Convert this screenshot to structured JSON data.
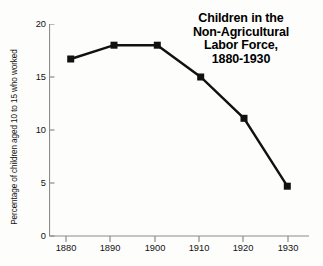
{
  "chart_data": {
    "type": "line",
    "title": "Children in the Non-Agricultural Labor Force, 1880-1930",
    "title_lines": [
      "Children in the",
      "Non-Agricultural",
      "Labor Force,",
      "1880-1930"
    ],
    "xlabel": "",
    "ylabel": "Percentage of children aged 10 to 15 who worked",
    "categories": [
      "1880",
      "1890",
      "1900",
      "1910",
      "1920",
      "1930"
    ],
    "x": [
      1880,
      1890,
      1900,
      1910,
      1920,
      1930
    ],
    "values": [
      16.7,
      18.0,
      18.0,
      15.0,
      11.1,
      4.7
    ],
    "series": [
      {
        "name": "Percentage of children aged 10 to 15 who worked",
        "values": [
          16.7,
          18.0,
          18.0,
          15.0,
          11.1,
          4.7
        ]
      }
    ],
    "xlim": [
      1875,
      1935
    ],
    "ylim": [
      0,
      20
    ],
    "ytick_labels": [
      "0",
      "5",
      "10",
      "15",
      "20"
    ],
    "yticks": [
      0,
      5,
      10,
      15,
      20
    ],
    "xtick_labels": [
      "1880",
      "1890",
      "1900",
      "1910",
      "1920",
      "1930"
    ],
    "grid": false,
    "legend": false,
    "legend_position": "none",
    "marker": "square",
    "line_color": "#111111",
    "marker_color": "#111111",
    "axis_color": "#888888",
    "background_color": "#fdfdfc"
  }
}
